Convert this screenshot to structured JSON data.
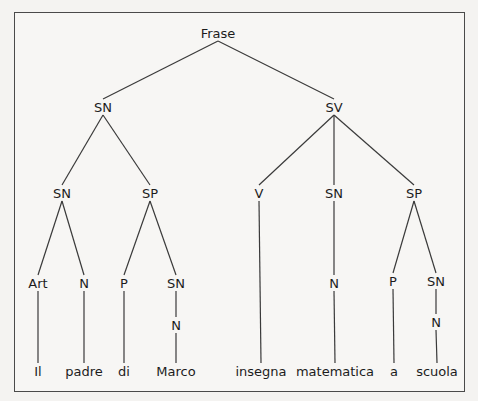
{
  "tree": {
    "nodes": {
      "frase": {
        "label": "Frase",
        "x": 218,
        "y": 33
      },
      "sn1": {
        "label": "SN",
        "x": 103,
        "y": 107
      },
      "sv": {
        "label": "SV",
        "x": 334,
        "y": 107
      },
      "sn2": {
        "label": "SN",
        "x": 62,
        "y": 193
      },
      "sp1": {
        "label": "SP",
        "x": 150,
        "y": 193
      },
      "v": {
        "label": "V",
        "x": 259,
        "y": 193
      },
      "sn3": {
        "label": "SN",
        "x": 334,
        "y": 193
      },
      "sp2": {
        "label": "SP",
        "x": 414,
        "y": 193
      },
      "art": {
        "label": "Art",
        "x": 38,
        "y": 283
      },
      "n1": {
        "label": "N",
        "x": 84,
        "y": 283
      },
      "p1": {
        "label": "P",
        "x": 124,
        "y": 283
      },
      "sn4": {
        "label": "SN",
        "x": 176,
        "y": 283
      },
      "n3": {
        "label": "N",
        "x": 334,
        "y": 283
      },
      "p2": {
        "label": "P",
        "x": 393,
        "y": 281
      },
      "sn5": {
        "label": "SN",
        "x": 436,
        "y": 281
      },
      "n2": {
        "label": "N",
        "x": 176,
        "y": 325
      },
      "n4": {
        "label": "N",
        "x": 436,
        "y": 322
      },
      "w_il": {
        "label": "Il",
        "x": 38,
        "y": 371
      },
      "w_padre": {
        "label": "padre",
        "x": 84,
        "y": 371
      },
      "w_di": {
        "label": "di",
        "x": 124,
        "y": 371
      },
      "w_marco": {
        "label": "Marco",
        "x": 176,
        "y": 371
      },
      "w_insegna": {
        "label": "insegna",
        "x": 261,
        "y": 371
      },
      "w_matematica": {
        "label": "matematica",
        "x": 335,
        "y": 371
      },
      "w_a": {
        "label": "a",
        "x": 394,
        "y": 371
      },
      "w_scuola": {
        "label": "scuola",
        "x": 437,
        "y": 371
      }
    },
    "edges": [
      [
        "frase",
        "sn1"
      ],
      [
        "frase",
        "sv"
      ],
      [
        "sn1",
        "sn2"
      ],
      [
        "sn1",
        "sp1"
      ],
      [
        "sv",
        "v"
      ],
      [
        "sv",
        "sn3"
      ],
      [
        "sv",
        "sp2"
      ],
      [
        "sn2",
        "art"
      ],
      [
        "sn2",
        "n1"
      ],
      [
        "sp1",
        "p1"
      ],
      [
        "sp1",
        "sn4"
      ],
      [
        "sn4",
        "n2"
      ],
      [
        "sn3",
        "n3"
      ],
      [
        "sp2",
        "p2"
      ],
      [
        "sp2",
        "sn5"
      ],
      [
        "sn5",
        "n4"
      ],
      [
        "art",
        "w_il"
      ],
      [
        "n1",
        "w_padre"
      ],
      [
        "p1",
        "w_di"
      ],
      [
        "n2",
        "w_marco"
      ],
      [
        "v",
        "w_insegna"
      ],
      [
        "n3",
        "w_matematica"
      ],
      [
        "p2",
        "w_a"
      ],
      [
        "n4",
        "w_scuola"
      ]
    ]
  }
}
